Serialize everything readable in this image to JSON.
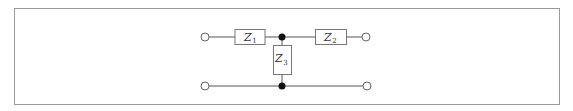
{
  "diagram": {
    "type": "T-network two-port circuit",
    "colors": {
      "frame": "#9a9a9a",
      "wire": "#555555",
      "box_stroke": "#777777",
      "node_fill": "#111111",
      "terminal_stroke": "#666666",
      "text": "#333333"
    },
    "impedances": [
      {
        "id": "Z1",
        "symbol": "Z",
        "subscript": "1",
        "position": "series-left"
      },
      {
        "id": "Z2",
        "symbol": "Z",
        "subscript": "2",
        "position": "series-right"
      },
      {
        "id": "Z3",
        "symbol": "Z",
        "subscript": "3",
        "position": "shunt"
      }
    ],
    "terminals": [
      {
        "id": "in-top",
        "position": "top-left"
      },
      {
        "id": "out-top",
        "position": "top-right"
      },
      {
        "id": "in-bottom",
        "position": "bottom-left"
      },
      {
        "id": "out-bottom",
        "position": "bottom-right"
      }
    ],
    "nodes": [
      {
        "id": "junction-top"
      },
      {
        "id": "junction-bottom"
      }
    ]
  }
}
